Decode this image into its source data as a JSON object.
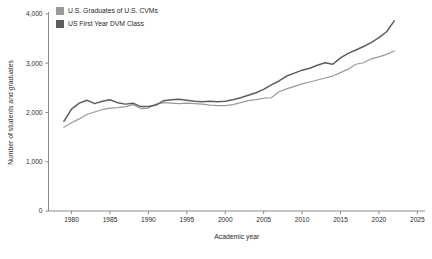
{
  "chart_data": {
    "type": "line",
    "title": "",
    "xlabel": "Academic year",
    "ylabel": "Number of students and graduates",
    "xlim": [
      1977,
      2026
    ],
    "ylim": [
      0,
      4000
    ],
    "xticks": [
      "1980",
      "1985",
      "1990",
      "1995",
      "2000",
      "2005",
      "2010",
      "2015",
      "2020",
      "2025"
    ],
    "yticks": [
      "0",
      "1,000",
      "2,000",
      "3,000",
      "4,000"
    ],
    "grid": false,
    "legend_position": "top-left",
    "x": [
      1979,
      1980,
      1981,
      1982,
      1983,
      1984,
      1985,
      1986,
      1987,
      1988,
      1989,
      1990,
      1991,
      1992,
      1993,
      1994,
      1995,
      1996,
      1997,
      1998,
      1999,
      2000,
      2001,
      2002,
      2003,
      2004,
      2005,
      2006,
      2007,
      2008,
      2009,
      2010,
      2011,
      2012,
      2013,
      2014,
      2015,
      2016,
      2017,
      2018,
      2019,
      2020,
      2021,
      2022
    ],
    "series": [
      {
        "name": "U.S. Graduates of U.S. CVMs",
        "color": "#9a9a9a",
        "values": [
          1700,
          1790,
          1870,
          1960,
          2010,
          2060,
          2090,
          2100,
          2120,
          2160,
          2080,
          2090,
          2170,
          2200,
          2190,
          2180,
          2190,
          2180,
          2170,
          2150,
          2140,
          2140,
          2160,
          2200,
          2240,
          2260,
          2290,
          2300,
          2420,
          2480,
          2530,
          2580,
          2620,
          2660,
          2700,
          2740,
          2810,
          2880,
          2980,
          3010,
          3090,
          3130,
          3180,
          3250
        ]
      },
      {
        "name": "US First Year DVM Class",
        "color": "#5e5e5e",
        "values": [
          1820,
          2070,
          2190,
          2250,
          2180,
          2230,
          2260,
          2200,
          2170,
          2190,
          2120,
          2120,
          2150,
          2240,
          2260,
          2270,
          2250,
          2230,
          2220,
          2230,
          2220,
          2230,
          2260,
          2300,
          2350,
          2400,
          2470,
          2560,
          2640,
          2740,
          2800,
          2860,
          2900,
          2960,
          3010,
          2980,
          3110,
          3200,
          3270,
          3340,
          3420,
          3520,
          3640,
          3860
        ]
      }
    ]
  },
  "legend": {
    "items": [
      {
        "label": "U.S. Graduates of U.S. CVMs",
        "color": "#9a9a9a"
      },
      {
        "label": "US First Year DVM Class",
        "color": "#5e5e5e"
      }
    ]
  }
}
